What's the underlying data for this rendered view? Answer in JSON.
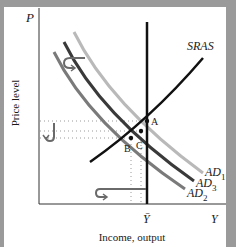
{
  "diagram": {
    "axes": {
      "y_axis_symbol": "P",
      "y_axis_title": "Price level",
      "x_axis_symbol": "Y",
      "x_axis_title": "Income, output",
      "x_marker_label": "Ȳ"
    },
    "curves": {
      "sras": {
        "label": "SRAS",
        "color": "#111111"
      },
      "lras": {
        "label": "",
        "color": "#111111"
      },
      "ad1": {
        "label": "AD",
        "sub": "1",
        "color": "#b9b9b9"
      },
      "ad3": {
        "label": "AD",
        "sub": "3",
        "color": "#3a3a3a"
      },
      "ad2": {
        "label": "AD",
        "sub": "2",
        "color": "#7a7a7a"
      }
    },
    "points": {
      "a": "A",
      "b": "B",
      "c": "C"
    },
    "colors": {
      "frame": "#9a9a9a",
      "background": "#ffffff",
      "axis": "#333333",
      "guide_dots": "#9a9a9a",
      "arrow": "#6a6a6a"
    }
  }
}
